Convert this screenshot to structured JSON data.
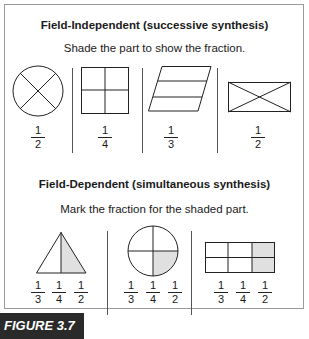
{
  "figure": {
    "label": "FIGURE 3.7",
    "caption_fragment": ""
  },
  "section1": {
    "title": "Field-Independent (successive synthesis)",
    "instruction": "Shade the part to show the fraction.",
    "items": [
      {
        "shape": "circle-divided-in-4-by-diagonals",
        "fraction": {
          "num": "1",
          "den": "2"
        }
      },
      {
        "shape": "square-divided-in-4",
        "fraction": {
          "num": "1",
          "den": "4"
        }
      },
      {
        "shape": "parallelogram-divided-in-3",
        "fraction": {
          "num": "1",
          "den": "3"
        }
      },
      {
        "shape": "rectangle-with-diagonals",
        "fraction": {
          "num": "1",
          "den": "2"
        }
      }
    ]
  },
  "section2": {
    "title": "Field-Dependent (simultaneous synthesis)",
    "instruction": "Mark the fraction for the shaded part.",
    "items": [
      {
        "shape": "triangle-half-shaded",
        "options": [
          {
            "num": "1",
            "den": "3"
          },
          {
            "num": "1",
            "den": "4"
          },
          {
            "num": "1",
            "den": "2"
          }
        ]
      },
      {
        "shape": "circle-quarter-shaded",
        "options": [
          {
            "num": "1",
            "den": "3"
          },
          {
            "num": "1",
            "den": "4"
          },
          {
            "num": "1",
            "den": "2"
          }
        ]
      },
      {
        "shape": "rectangle-6-parts-2-shaded",
        "options": [
          {
            "num": "1",
            "den": "3"
          },
          {
            "num": "1",
            "den": "4"
          },
          {
            "num": "1",
            "den": "2"
          }
        ]
      }
    ]
  },
  "colors": {
    "shade": "#e0e0e0",
    "line": "#222222",
    "label_bg": "#2a2a2a"
  }
}
